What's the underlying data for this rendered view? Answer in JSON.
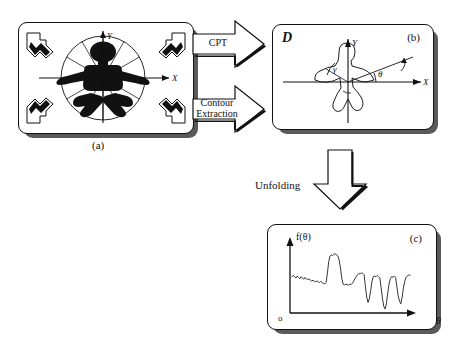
{
  "figure": {
    "background": "#ffffff",
    "ink": "#111111",
    "shadow_color": "#5a5a5a"
  },
  "panels": [
    {
      "id": "a",
      "caption": "(a)",
      "corner_label": "",
      "description": "Binary silhouette of a figure centred in a polar sampling grid with X and Y axes, a bounding circle and radial spokes; four inward-pointing corner arrows.",
      "axis_x": "X",
      "axis_y": "Y",
      "radial_spokes": 12,
      "corner_arrows": 4
    },
    {
      "id": "b",
      "caption": "(b)",
      "corner_label": "D",
      "description": "Extracted contour outline of the silhouette in a Cartesian frame with rotating radius showing angles gamma and theta.",
      "axis_x": "X",
      "axis_y": "Y",
      "angle_theta": "θ",
      "angle_gamma": "γ"
    },
    {
      "id": "c",
      "caption": "(c)",
      "corner_label": "",
      "description": "Unfolded radial signature plotted as f(theta) against theta.",
      "axis_x": "θ",
      "axis_y": "f(θ)",
      "origin_label": "o"
    }
  ],
  "arrows": [
    {
      "id": "cpt",
      "label": "CPT",
      "direction": "right"
    },
    {
      "id": "contour-extraction",
      "label": "Contour\nExtraction",
      "direction": "right"
    },
    {
      "id": "unfolding",
      "label": "Unfolding",
      "direction": "down"
    }
  ],
  "chart_data": {
    "type": "line",
    "title": "",
    "xlabel": "θ",
    "ylabel": "f(θ)",
    "xlim": [
      0,
      360
    ],
    "ylim": [
      0,
      1
    ],
    "grid": false,
    "legend": "none",
    "x": [
      0,
      4,
      8,
      12,
      16,
      20,
      24,
      28,
      32,
      36,
      40,
      44,
      48,
      52,
      56,
      60,
      64,
      68,
      72,
      76,
      80,
      84,
      88,
      92,
      96,
      100,
      104,
      108,
      112,
      116,
      120,
      124,
      128,
      132,
      136,
      140,
      144,
      148,
      152,
      156,
      160,
      164,
      168,
      172,
      176,
      180,
      184,
      188,
      192,
      196,
      200,
      204,
      208,
      212,
      216,
      220,
      224,
      228,
      232,
      236,
      240,
      244,
      248,
      252,
      256,
      260,
      264,
      268,
      272,
      276,
      280,
      284,
      288,
      292,
      296,
      300,
      304,
      308,
      312,
      316,
      320,
      324,
      328,
      332,
      336,
      340,
      344,
      348,
      352,
      356,
      360
    ],
    "values": [
      0.55,
      0.57,
      0.55,
      0.53,
      0.56,
      0.54,
      0.52,
      0.55,
      0.53,
      0.51,
      0.54,
      0.52,
      0.5,
      0.52,
      0.5,
      0.48,
      0.5,
      0.48,
      0.47,
      0.49,
      0.47,
      0.46,
      0.48,
      0.46,
      0.45,
      0.44,
      0.46,
      0.6,
      0.78,
      0.86,
      0.88,
      0.87,
      0.89,
      0.9,
      0.88,
      0.86,
      0.8,
      0.68,
      0.52,
      0.44,
      0.42,
      0.44,
      0.43,
      0.42,
      0.44,
      0.43,
      0.45,
      0.48,
      0.52,
      0.55,
      0.58,
      0.6,
      0.59,
      0.61,
      0.6,
      0.58,
      0.4,
      0.24,
      0.16,
      0.22,
      0.34,
      0.48,
      0.55,
      0.56,
      0.55,
      0.57,
      0.55,
      0.53,
      0.38,
      0.22,
      0.1,
      0.06,
      0.14,
      0.3,
      0.44,
      0.52,
      0.55,
      0.54,
      0.56,
      0.54,
      0.4,
      0.26,
      0.18,
      0.14,
      0.24,
      0.38,
      0.48,
      0.54,
      0.56,
      0.58,
      0.57
    ]
  }
}
